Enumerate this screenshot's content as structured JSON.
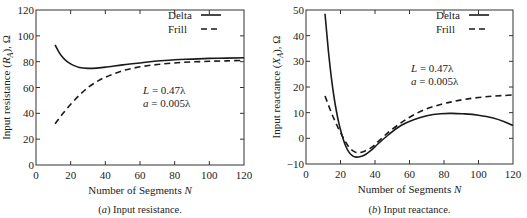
{
  "chart_data": [
    {
      "type": "line",
      "title": "",
      "caption_prefix": "(a)",
      "caption_text": " Input resistance.",
      "xlabel": "Number of Segments N",
      "ylabel": "Input resistance (R_A), Ω",
      "xlim": [
        0,
        120
      ],
      "ylim": [
        0,
        120
      ],
      "xticks": [
        0,
        20,
        40,
        60,
        80,
        100,
        120
      ],
      "yticks": [
        0,
        20,
        40,
        60,
        80,
        100,
        120
      ],
      "grid": false,
      "legend_position": "upper right",
      "annotations": [
        "L = 0.47λ",
        "a = 0.005λ"
      ],
      "series": [
        {
          "name": "Delta",
          "style": "solid",
          "x": [
            11,
            13,
            15,
            18,
            21,
            25,
            30,
            35,
            40,
            50,
            60,
            70,
            80,
            90,
            100,
            110,
            120
          ],
          "values": [
            93,
            88,
            84,
            80,
            77.5,
            75.5,
            74.8,
            75,
            75.8,
            77.5,
            79,
            80.5,
            81.5,
            82,
            82.5,
            82.8,
            83
          ]
        },
        {
          "name": "Frill",
          "style": "dashed",
          "x": [
            11,
            15,
            20,
            25,
            30,
            35,
            40,
            50,
            60,
            70,
            80,
            90,
            100,
            110,
            120
          ],
          "values": [
            32,
            39,
            47,
            54,
            60,
            64.5,
            68,
            73,
            76,
            77.8,
            79,
            79.8,
            80.3,
            80.6,
            81
          ]
        }
      ]
    },
    {
      "type": "line",
      "title": "",
      "caption_prefix": "(b)",
      "caption_text": " Input reactance.",
      "xlabel": "Number of Segments N",
      "ylabel": "Input reactance (X_A), Ω",
      "xlim": [
        0,
        120
      ],
      "ylim": [
        -10,
        50
      ],
      "xticks": [
        0,
        20,
        40,
        60,
        80,
        100,
        120
      ],
      "yticks": [
        -10,
        0,
        10,
        20,
        30,
        40,
        50
      ],
      "grid": false,
      "legend_position": "upper right",
      "annotations": [
        "L = 0.47λ",
        "a = 0.005λ"
      ],
      "series": [
        {
          "name": "Delta",
          "style": "solid",
          "x": [
            11,
            13,
            15,
            17,
            19,
            21,
            23,
            25,
            27,
            29,
            31,
            34,
            38,
            42,
            48,
            55,
            62,
            70,
            78,
            85,
            92,
            100,
            108,
            115,
            120
          ],
          "values": [
            48.5,
            34,
            22,
            13,
            6,
            1,
            -3,
            -5.5,
            -6.8,
            -7.3,
            -7.2,
            -6.5,
            -4.5,
            -2,
            1.5,
            5,
            7.2,
            8.8,
            9.6,
            9.7,
            9.5,
            9,
            8,
            6.5,
            5
          ]
        },
        {
          "name": "Frill",
          "style": "dashed",
          "x": [
            11,
            13,
            15,
            17,
            19,
            21,
            23,
            25,
            27,
            29,
            31,
            34,
            38,
            42,
            48,
            55,
            62,
            70,
            78,
            85,
            92,
            100,
            108,
            115,
            120
          ],
          "values": [
            16.5,
            13,
            9.5,
            6.5,
            3.5,
            1,
            -1.5,
            -3.5,
            -4.8,
            -5.5,
            -5.6,
            -5,
            -3.5,
            -1.2,
            2.5,
            6,
            9,
            11.5,
            13.2,
            14.3,
            15.2,
            15.9,
            16.4,
            16.7,
            16.9
          ]
        }
      ]
    }
  ]
}
